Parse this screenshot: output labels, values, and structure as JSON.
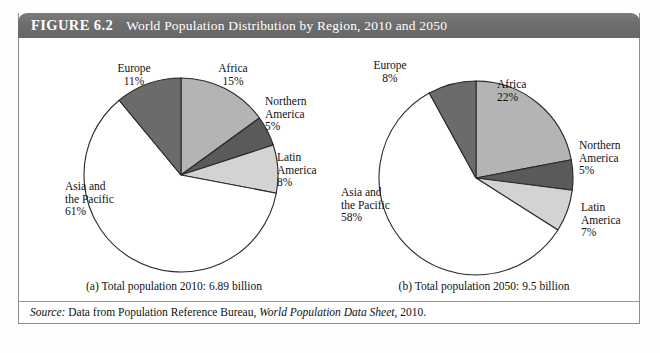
{
  "figure": {
    "number_label": "FIGURE 6.2",
    "title": "World Population Distribution by Region, 2010 and 2050"
  },
  "panels": [
    {
      "id": "panel-a",
      "caption": "(a) Total population 2010: 6.89 billion",
      "labels": {
        "africa_name": "Africa",
        "africa_pct": "15%",
        "northern_america_name_1": "Northern",
        "northern_america_name_2": "America",
        "northern_america_pct": "5%",
        "latin_america_name_1": "Latin",
        "latin_america_name_2": "America",
        "latin_america_pct": "8%",
        "asia_name_1": "Asia and",
        "asia_name_2": "the Pacific",
        "asia_pct": "61%",
        "europe_name": "Europe",
        "europe_pct": "11%"
      }
    },
    {
      "id": "panel-b",
      "caption": "(b) Total population 2050: 9.5 billion",
      "labels": {
        "africa_name": "Africa",
        "africa_pct": "22%",
        "northern_america_name_1": "Northern",
        "northern_america_name_2": "America",
        "northern_america_pct": "5%",
        "latin_america_name_1": "Latin",
        "latin_america_name_2": "America",
        "latin_america_pct": "7%",
        "asia_name_1": "Asia and",
        "asia_name_2": "the Pacific",
        "asia_pct": "58%",
        "europe_name": "Europe",
        "europe_pct": "8%"
      }
    }
  ],
  "source": {
    "label": "Source:",
    "text_1": " Data from Population Reference Bureau, ",
    "italic_title": "World Population Data Sheet",
    "text_2": ", 2010."
  },
  "colors": {
    "header_bar": "#6e6e6e",
    "header_text": "#ffffff",
    "frame_border": "#8d8d8d",
    "africa_fill": "#b4b4b4",
    "northern_america_fill": "#5a5a5a",
    "latin_america_fill": "#d3d3d3",
    "asia_fill": "#ffffff",
    "europe_fill": "#6b6b6b",
    "slice_stroke": "#2a2a2a",
    "page_background": "#ffffff"
  },
  "chart_data": [
    {
      "type": "pie",
      "title": "(a) Total population 2010: 6.89 billion",
      "categories": [
        "Africa",
        "Northern America",
        "Latin America",
        "Asia and the Pacific",
        "Europe"
      ],
      "values": [
        15,
        5,
        8,
        61,
        11
      ],
      "unit": "percent",
      "total_population": "6.89 billion",
      "year": 2010,
      "legend": "none",
      "labels_inline": true
    },
    {
      "type": "pie",
      "title": "(b) Total population 2050: 9.5 billion",
      "categories": [
        "Africa",
        "Northern America",
        "Latin America",
        "Asia and the Pacific",
        "Europe"
      ],
      "values": [
        22,
        5,
        7,
        58,
        8
      ],
      "unit": "percent",
      "total_population": "9.5 billion",
      "year": 2050,
      "legend": "none",
      "labels_inline": true
    }
  ]
}
